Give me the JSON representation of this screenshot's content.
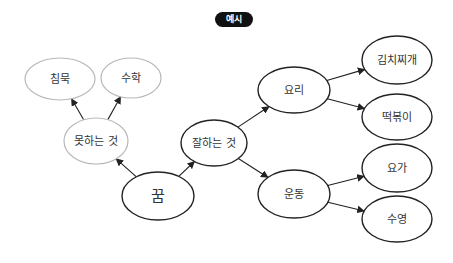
{
  "badge": {
    "label": "예시"
  },
  "colors": {
    "strong": "#222222",
    "weak": "#b8b8b8",
    "text": "#333333",
    "badge_bg": "#111111"
  },
  "nodes": [
    {
      "id": "dream",
      "label": "꿈",
      "cx": 158,
      "cy": 196,
      "rx": 36,
      "ry": 24,
      "style": "strong",
      "size": 15
    },
    {
      "id": "cant_do",
      "label": "못하는 것",
      "cx": 96,
      "cy": 141,
      "rx": 32,
      "ry": 23,
      "style": "weak",
      "size": 11
    },
    {
      "id": "silence",
      "label": "침묵",
      "cx": 60,
      "cy": 79,
      "rx": 35,
      "ry": 21,
      "style": "weak",
      "size": 11
    },
    {
      "id": "math",
      "label": "수학",
      "cx": 131,
      "cy": 78,
      "rx": 30,
      "ry": 20,
      "style": "weak",
      "size": 11
    },
    {
      "id": "good_at",
      "label": "잘하는 것",
      "cx": 214,
      "cy": 143,
      "rx": 33,
      "ry": 23,
      "style": "strong",
      "size": 11
    },
    {
      "id": "cooking",
      "label": "요리",
      "cx": 294,
      "cy": 90,
      "rx": 36,
      "ry": 23,
      "style": "strong",
      "size": 11
    },
    {
      "id": "exercise",
      "label": "운동",
      "cx": 294,
      "cy": 194,
      "rx": 36,
      "ry": 24,
      "style": "strong",
      "size": 11
    },
    {
      "id": "kimchi",
      "label": "김치찌개",
      "cx": 397,
      "cy": 60,
      "rx": 35,
      "ry": 24,
      "style": "strong",
      "size": 11
    },
    {
      "id": "tteok",
      "label": "떡볶이",
      "cx": 397,
      "cy": 117,
      "rx": 35,
      "ry": 23,
      "style": "strong",
      "size": 11
    },
    {
      "id": "yoga",
      "label": "요가",
      "cx": 397,
      "cy": 168,
      "rx": 35,
      "ry": 24,
      "style": "strong",
      "size": 11
    },
    {
      "id": "swim",
      "label": "수영",
      "cx": 397,
      "cy": 219,
      "rx": 35,
      "ry": 23,
      "style": "strong",
      "size": 11
    }
  ],
  "edges": [
    {
      "from": "dream",
      "to": "cant_do"
    },
    {
      "from": "dream",
      "to": "good_at"
    },
    {
      "from": "cant_do",
      "to": "silence"
    },
    {
      "from": "cant_do",
      "to": "math"
    },
    {
      "from": "good_at",
      "to": "cooking"
    },
    {
      "from": "good_at",
      "to": "exercise"
    },
    {
      "from": "cooking",
      "to": "kimchi"
    },
    {
      "from": "cooking",
      "to": "tteok"
    },
    {
      "from": "exercise",
      "to": "yoga"
    },
    {
      "from": "exercise",
      "to": "swim"
    }
  ]
}
